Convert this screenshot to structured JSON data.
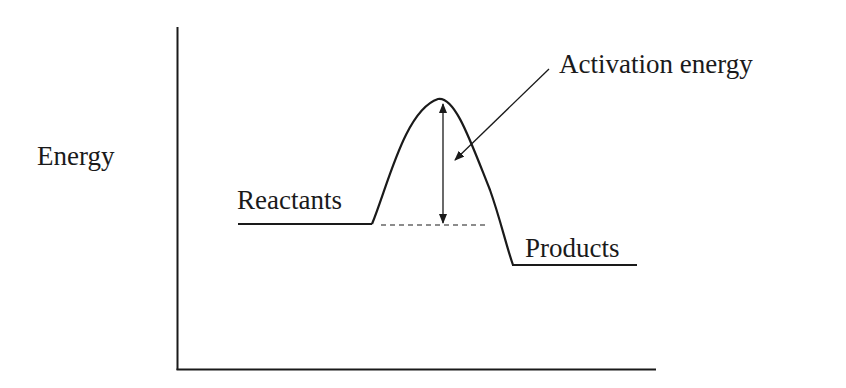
{
  "diagram": {
    "type": "energy-profile",
    "axes": {
      "y_label": "Energy",
      "x_label": ""
    },
    "labels": {
      "reactants": "Reactants",
      "products": "Products",
      "activation_energy": "Activation energy"
    },
    "levels": {
      "reactants_y": 224,
      "transition_state_y": 99,
      "products_y": 265
    },
    "colors": {
      "line": "#1a1a1a",
      "background": "#ffffff"
    }
  }
}
